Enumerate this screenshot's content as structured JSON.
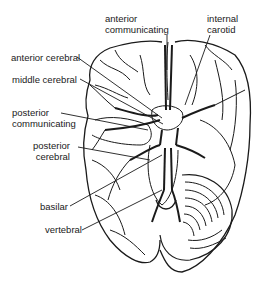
{
  "diagram": {
    "labels": {
      "anterior_communicating": [
        "anterior",
        "communicating"
      ],
      "internal_carotid": [
        "internal",
        "carotid"
      ],
      "anterior_cerebral": "anterior cerebral",
      "middle_cerebral": "middle cerebral",
      "posterior_communicating": [
        "posterior",
        "communicating"
      ],
      "posterior_cerebral": [
        "posterior",
        "cerebral"
      ],
      "basilar": "basilar",
      "vertebral": "vertebral"
    },
    "colors": {
      "ink": "#1a1a1a",
      "background": "#ffffff"
    }
  }
}
